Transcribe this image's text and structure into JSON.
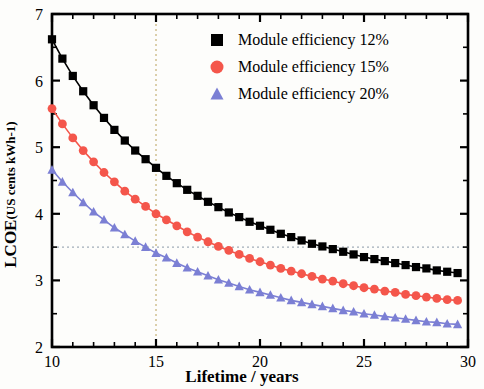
{
  "chart_data": {
    "type": "line",
    "title": "",
    "xlabel": "Lifetime / years",
    "ylabel_main": "LCOE",
    "ylabel_unit": "(US cents kWh",
    "ylabel_unit_sup": "-1",
    "ylabel_unit_close": ")",
    "xlim": [
      10,
      30
    ],
    "ylim": [
      2,
      7
    ],
    "xticks": [
      10,
      15,
      20,
      25,
      30
    ],
    "yticks": [
      2,
      3,
      4,
      5,
      6,
      7
    ],
    "grid": "dotted guide lines at x=15 and y=3.5",
    "legend_position": "top-right",
    "series": [
      {
        "name": "Module efficiency 12%",
        "color": "#000000",
        "marker": "square",
        "x": [
          10,
          10.5,
          11,
          11.5,
          12,
          12.5,
          13,
          13.5,
          14,
          14.5,
          15,
          15.5,
          16,
          16.5,
          17,
          17.5,
          18,
          18.5,
          19,
          19.5,
          20,
          20.5,
          21,
          21.5,
          22,
          22.5,
          23,
          23.5,
          24,
          24.5,
          25,
          25.5,
          26,
          26.5,
          27,
          27.5,
          28,
          28.5,
          29,
          29.5,
          30
        ],
        "y": [
          6.62,
          6.33,
          6.07,
          5.84,
          5.63,
          5.44,
          5.26,
          5.1,
          4.95,
          4.82,
          4.69,
          4.57,
          4.46,
          4.36,
          4.27,
          4.18,
          4.1,
          4.02,
          3.95,
          3.88,
          3.82,
          3.76,
          3.7,
          3.65,
          3.6,
          3.55,
          3.51,
          3.47,
          3.43,
          3.39,
          3.35,
          3.32,
          3.29,
          3.26,
          3.23,
          3.2,
          3.18,
          3.15,
          3.13,
          3.11,
          3.35
        ]
      },
      {
        "name": "Module efficiency 15%",
        "color": "#f4564b",
        "marker": "circle",
        "x": [
          10,
          10.5,
          11,
          11.5,
          12,
          12.5,
          13,
          13.5,
          14,
          14.5,
          15,
          15.5,
          16,
          16.5,
          17,
          17.5,
          18,
          18.5,
          19,
          19.5,
          20,
          20.5,
          21,
          21.5,
          22,
          22.5,
          23,
          23.5,
          24,
          24.5,
          25,
          25.5,
          26,
          26.5,
          27,
          27.5,
          28,
          28.5,
          29,
          29.5,
          30
        ],
        "y": [
          5.58,
          5.35,
          5.14,
          4.95,
          4.78,
          4.62,
          4.48,
          4.34,
          4.22,
          4.11,
          4.0,
          3.91,
          3.82,
          3.73,
          3.65,
          3.58,
          3.51,
          3.45,
          3.39,
          3.33,
          3.28,
          3.23,
          3.18,
          3.14,
          3.1,
          3.06,
          3.02,
          2.99,
          2.95,
          2.92,
          2.89,
          2.87,
          2.84,
          2.82,
          2.79,
          2.77,
          2.75,
          2.73,
          2.71,
          2.7,
          2.9
        ]
      },
      {
        "name": "Module efficiency 20%",
        "color": "#7b7fd4",
        "marker": "triangle",
        "x": [
          10,
          10.5,
          11,
          11.5,
          12,
          12.5,
          13,
          13.5,
          14,
          14.5,
          15,
          15.5,
          16,
          16.5,
          17,
          17.5,
          18,
          18.5,
          19,
          19.5,
          20,
          20.5,
          21,
          21.5,
          22,
          22.5,
          23,
          23.5,
          24,
          24.5,
          25,
          25.5,
          26,
          26.5,
          27,
          27.5,
          28,
          28.5,
          29,
          29.5,
          30
        ],
        "y": [
          4.66,
          4.48,
          4.32,
          4.17,
          4.03,
          3.91,
          3.79,
          3.69,
          3.59,
          3.5,
          3.41,
          3.34,
          3.26,
          3.19,
          3.13,
          3.07,
          3.01,
          2.96,
          2.91,
          2.86,
          2.82,
          2.78,
          2.74,
          2.7,
          2.67,
          2.64,
          2.61,
          2.58,
          2.55,
          2.53,
          2.5,
          2.48,
          2.46,
          2.44,
          2.42,
          2.4,
          2.38,
          2.37,
          2.35,
          2.34,
          2.45
        ]
      }
    ]
  },
  "legend": {
    "items": [
      {
        "label": "Module efficiency 12%"
      },
      {
        "label": "Module efficiency 15%"
      },
      {
        "label": "Module efficiency 20%"
      }
    ]
  },
  "axes": {
    "x_label": "Lifetime / years",
    "y_label_prefix": "LCOE ",
    "y_label_unit_open": "(US cents kWh",
    "y_label_unit_sup": "-1",
    "y_label_unit_close": ")",
    "x_tick_labels": [
      "10",
      "15",
      "20",
      "25",
      "30"
    ],
    "y_tick_labels": [
      "2",
      "3",
      "4",
      "5",
      "6",
      "7"
    ]
  }
}
